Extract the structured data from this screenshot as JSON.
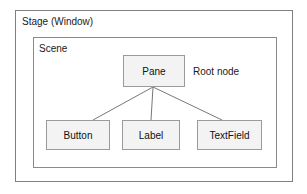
{
  "diagram": {
    "background_color": "#ffffff",
    "containers": [
      {
        "id": "stage",
        "label": "Stage (Window)",
        "border_color": "#808080"
      },
      {
        "id": "scene",
        "label": "Scene",
        "border_color": "#8a8a8a"
      }
    ],
    "annotations": [
      {
        "id": "root-note",
        "text": "Root node"
      }
    ],
    "nodes": [
      {
        "id": "pane",
        "label": "Pane",
        "fill": "#f3f3f3",
        "border_color": "#9a9a9a"
      },
      {
        "id": "button",
        "label": "Button",
        "fill": "#f3f3f3",
        "border_color": "#9a9a9a"
      },
      {
        "id": "label",
        "label": "Label",
        "fill": "#f3f3f3",
        "border_color": "#9a9a9a"
      },
      {
        "id": "textfield",
        "label": "TextField",
        "fill": "#f3f3f3",
        "border_color": "#9a9a9a"
      }
    ],
    "edges": [
      {
        "from": "pane",
        "to": "button"
      },
      {
        "from": "pane",
        "to": "label"
      },
      {
        "from": "pane",
        "to": "textfield"
      }
    ],
    "edge_color": "#777777"
  }
}
